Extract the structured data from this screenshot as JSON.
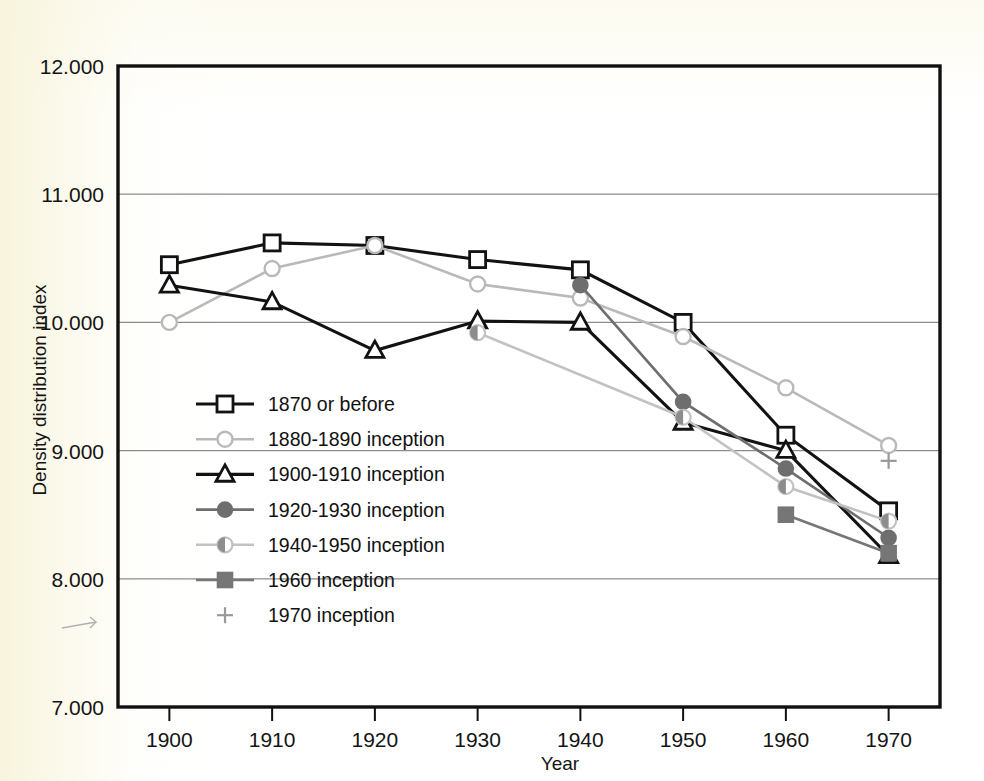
{
  "chart_data": {
    "type": "line",
    "title": "",
    "xlabel": "Year",
    "ylabel": "Density distribution index",
    "x": [
      1900,
      1910,
      1920,
      1930,
      1940,
      1950,
      1960,
      1970
    ],
    "xticklabels": [
      "1900",
      "1910",
      "1920",
      "1930",
      "1940",
      "1950",
      "1960",
      "1970"
    ],
    "yticklabels": [
      "7.000",
      "8.000",
      "9.000",
      "10.000",
      "11.000",
      "12.000"
    ],
    "yticks": [
      7.0,
      8.0,
      9.0,
      10.0,
      11.0,
      12.0
    ],
    "xlim": [
      1895,
      1975
    ],
    "ylim": [
      7.0,
      12.0
    ],
    "grid": "horizontal",
    "legend_position": "inside-left-middle",
    "series": [
      {
        "name": "1870 or before",
        "marker": "open-square",
        "color": "#121212",
        "linewidth": 3.1,
        "x": [
          1900,
          1910,
          1920,
          1930,
          1940,
          1950,
          1960,
          1970
        ],
        "values": [
          10.45,
          10.62,
          10.6,
          10.49,
          10.41,
          10.0,
          9.12,
          8.53
        ]
      },
      {
        "name": "1880-1890 inception",
        "marker": "open-circle",
        "color": "#b9b9b9",
        "linewidth": 2.6,
        "x": [
          1900,
          1910,
          1920,
          1930,
          1940,
          1950,
          1960,
          1970
        ],
        "values": [
          10.0,
          10.42,
          10.6,
          10.3,
          10.19,
          9.89,
          9.49,
          9.04
        ]
      },
      {
        "name": "1900-1910 inception",
        "marker": "open-triangle",
        "color": "#121212",
        "linewidth": 3.1,
        "x": [
          1900,
          1910,
          1920,
          1930,
          1940,
          1950,
          1960,
          1970
        ],
        "values": [
          10.29,
          10.16,
          9.78,
          10.01,
          10.0,
          9.22,
          9.0,
          8.18
        ]
      },
      {
        "name": "1920-1930 inception",
        "marker": "filled-circle",
        "color": "#6e6e6e",
        "linewidth": 2.6,
        "x": [
          1940,
          1950,
          1960,
          1970
        ],
        "values": [
          10.29,
          9.38,
          8.86,
          8.32
        ]
      },
      {
        "name": "1940-1950 inception",
        "marker": "half-filled-circle",
        "color": "#c2c2c2",
        "linewidth": 2.6,
        "x": [
          1930,
          1950,
          1960,
          1970
        ],
        "values": [
          9.92,
          9.26,
          8.72,
          8.45
        ]
      },
      {
        "name": "1960 inception",
        "marker": "filled-square",
        "color": "#767676",
        "linewidth": 2.6,
        "x": [
          1960,
          1970
        ],
        "values": [
          8.5,
          8.2
        ]
      },
      {
        "name": "1970 inception",
        "marker": "plus",
        "color": "#999999",
        "linewidth": 0,
        "x": [
          1970
        ],
        "values": [
          8.92
        ]
      }
    ]
  },
  "legend": {
    "items": [
      {
        "label": "1870 or before",
        "marker": "open-square",
        "color": "#121212",
        "linewidth": 3.1
      },
      {
        "label": "1880-1890 inception",
        "marker": "open-circle",
        "color": "#b9b9b9",
        "linewidth": 2.6
      },
      {
        "label": "1900-1910 inception",
        "marker": "open-triangle",
        "color": "#121212",
        "linewidth": 3.1
      },
      {
        "label": "1920-1930 inception",
        "marker": "filled-circle",
        "color": "#6e6e6e",
        "linewidth": 2.6
      },
      {
        "label": "1940-1950 inception",
        "marker": "half-filled-circle",
        "color": "#c2c2c2",
        "linewidth": 2.6
      },
      {
        "label": "1960 inception",
        "marker": "filled-square",
        "color": "#767676",
        "linewidth": 2.6
      },
      {
        "label": "1970 inception",
        "marker": "plus",
        "color": "#999999",
        "linewidth": 0
      }
    ]
  },
  "colors": {
    "axis": "#101010",
    "gridline": "#8c8c8c",
    "plot_background": "#ffffff",
    "page_background": "#f8f4e0"
  }
}
